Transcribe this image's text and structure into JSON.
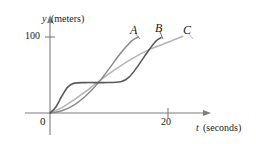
{
  "chart_data": {
    "type": "line",
    "title": "",
    "xlabel": "t (seconds)",
    "ylabel": "y (meters)",
    "xlabel_var": "t",
    "xlabel_units": "(seconds)",
    "ylabel_var": "y",
    "ylabel_units": "(meters)",
    "xlim": [
      0,
      26
    ],
    "ylim": [
      0,
      125
    ],
    "grid": false,
    "legend": "inline-end-labels",
    "x_ticks": [
      {
        "value": 20,
        "label": "20"
      }
    ],
    "y_ticks": [
      {
        "value": 100,
        "label": "100"
      }
    ],
    "origin_label": "0",
    "series": [
      {
        "name": "A",
        "label": "A",
        "color": "#8a8a8a",
        "description": "steep sigmoid rising early to about 100 meters",
        "points": [
          {
            "t": 0,
            "y": 0
          },
          {
            "t": 2,
            "y": 3
          },
          {
            "t": 4,
            "y": 10
          },
          {
            "t": 6,
            "y": 22
          },
          {
            "t": 8,
            "y": 38
          },
          {
            "t": 10,
            "y": 58
          },
          {
            "t": 11.5,
            "y": 74
          },
          {
            "t": 13,
            "y": 88
          },
          {
            "t": 14,
            "y": 96
          },
          {
            "t": 15,
            "y": 100
          }
        ]
      },
      {
        "name": "B",
        "label": "B",
        "color": "#5a5a5a",
        "description": "rises quickly, long plateau near 40 meters, then steep climb to about 100 meters",
        "points": [
          {
            "t": 0,
            "y": 0
          },
          {
            "t": 1,
            "y": 8
          },
          {
            "t": 2,
            "y": 22
          },
          {
            "t": 3,
            "y": 34
          },
          {
            "t": 4,
            "y": 39
          },
          {
            "t": 6,
            "y": 40
          },
          {
            "t": 9,
            "y": 40
          },
          {
            "t": 12,
            "y": 41
          },
          {
            "t": 13.5,
            "y": 48
          },
          {
            "t": 15,
            "y": 63
          },
          {
            "t": 16.5,
            "y": 80
          },
          {
            "t": 18,
            "y": 95
          },
          {
            "t": 18.8,
            "y": 99
          }
        ]
      },
      {
        "name": "C",
        "label": "C",
        "color": "#b4b4b4",
        "description": "slow start then nearly linear increase past 100 meters",
        "points": [
          {
            "t": 0,
            "y": 0
          },
          {
            "t": 2,
            "y": 7
          },
          {
            "t": 4,
            "y": 17
          },
          {
            "t": 6,
            "y": 28
          },
          {
            "t": 8,
            "y": 40
          },
          {
            "t": 11,
            "y": 57
          },
          {
            "t": 14,
            "y": 72
          },
          {
            "t": 17,
            "y": 84
          },
          {
            "t": 20,
            "y": 93
          },
          {
            "t": 22.5,
            "y": 101
          }
        ]
      }
    ]
  },
  "axes": {
    "axis_color": "#777777",
    "curve_label_a": "A",
    "curve_label_b": "B",
    "curve_label_c": "C"
  }
}
